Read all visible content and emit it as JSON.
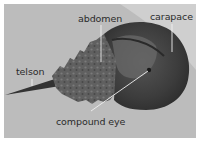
{
  "figure": {
    "colors": {
      "background_sand": "#bcbcbc",
      "sand_light": "#d6d6d6",
      "carapace_dark": "#3a3a3a",
      "abdomen": "#5e5e5e",
      "label_text": "#2b2b2b",
      "leader_line": "#f2f2f2"
    },
    "labels": [
      {
        "id": "abdomen",
        "text": "abdomen"
      },
      {
        "id": "carapace",
        "text": "carapace"
      },
      {
        "id": "telson",
        "text": "telson"
      },
      {
        "id": "compound_eye",
        "text": "compound eye"
      }
    ]
  }
}
